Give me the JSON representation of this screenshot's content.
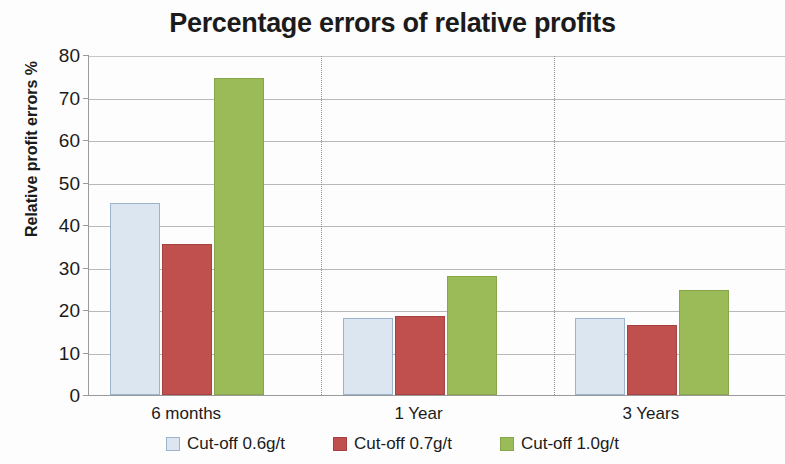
{
  "chart_data": {
    "type": "bar",
    "title": "Percentage errors of relative profits",
    "xlabel": "",
    "ylabel": "Relative profit errors %",
    "categories": [
      "6 months",
      "1 Year",
      "3 Years"
    ],
    "series": [
      {
        "name": "Cut-off 0.6g/t",
        "color": "#dce6f1",
        "values": [
          45.2,
          18.1,
          18.1
        ]
      },
      {
        "name": "Cut-off 0.7g/t",
        "color": "#c0504d",
        "values": [
          35.5,
          18.7,
          16.4
        ]
      },
      {
        "name": "Cut-off 1.0g/t",
        "color": "#9bbb59",
        "values": [
          74.5,
          28.0,
          24.7
        ]
      }
    ],
    "ylim": [
      0,
      80
    ],
    "yticks": [
      0,
      10,
      20,
      30,
      40,
      50,
      60,
      70,
      80
    ],
    "ytick_labels": [
      "0",
      "10",
      "20",
      "30",
      "40",
      "50",
      "60",
      "70",
      "80"
    ],
    "grid": "horizontal",
    "legend_position": "bottom",
    "category_separators": true
  }
}
